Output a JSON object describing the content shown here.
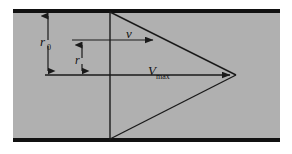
{
  "figure": {
    "background_color": "#ffffff",
    "panel_color": "#b0b0b0",
    "wall_color": "#111111",
    "line_color": "#1a1a1a"
  },
  "labels": {
    "pipe_radius": "r",
    "pipe_radius_sub": "0",
    "local_radius": "r",
    "local_velocity": "v",
    "max_velocity": "V",
    "max_velocity_sub": "max"
  },
  "geometry": {
    "panel_left": 13,
    "panel_right": 280,
    "panel_top": 10,
    "panel_bottom": 141,
    "wall_thickness": 4,
    "centerline_y": 75,
    "axis_x": 110,
    "apex_x": 236,
    "profile_top_y": 12,
    "profile_bottom_y": 139,
    "r0_dim_x": 48,
    "r_dim_x": 82,
    "r_dim_top_y": 40,
    "v_arrow_start_x": 82,
    "v_arrow_end_x": 157,
    "v_arrow_y": 40,
    "vmax_arrow_start_x": 45,
    "vmax_arrow_end_x": 234
  }
}
